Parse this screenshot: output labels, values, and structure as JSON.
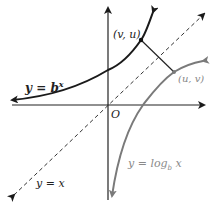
{
  "diagram": {
    "labels": {
      "exp_curve": "y = b",
      "exp_curve_sup": "x",
      "log_curve_prefix": "y = log",
      "log_curve_sub": "b",
      "log_curve_suffix": " x",
      "identity_line": "y = x",
      "origin": "O",
      "point_exp": "(v, u)",
      "point_log": "(u, v)"
    },
    "colors": {
      "axes": "#222222",
      "exp_curve": "#1a1a1a",
      "log_curve": "#7a7a7a",
      "identity_line": "#333333",
      "log_label": "#8a8a8a"
    }
  }
}
